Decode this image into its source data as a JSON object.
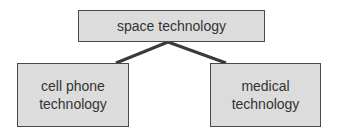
{
  "diagram": {
    "nodes": [
      {
        "id": "root",
        "label": "space technology"
      },
      {
        "id": "left",
        "label": "cell phone\ntechnology"
      },
      {
        "id": "right",
        "label": "medical\ntechnology"
      }
    ],
    "edges": [
      {
        "from": "root",
        "to": "left"
      },
      {
        "from": "root",
        "to": "right"
      }
    ],
    "colors": {
      "box_fill": "#dcdcdc",
      "box_border": "#4a4a4a",
      "line": "#3a3a3a",
      "text": "#333333"
    }
  }
}
